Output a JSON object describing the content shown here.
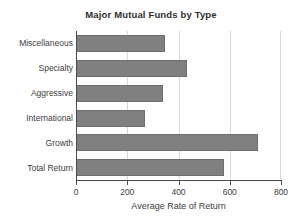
{
  "chart_data": {
    "type": "bar",
    "orientation": "horizontal",
    "title": "Major Mutual Funds by Type",
    "xlabel": "Average Rate of Return",
    "ylabel": "",
    "categories": [
      "Total Return",
      "Growth",
      "International",
      "Aggressive",
      "Specialty",
      "Miscellaneous"
    ],
    "values": [
      577,
      710,
      269,
      340,
      433,
      347
    ],
    "xlim": [
      0,
      800
    ],
    "xticks": [
      0,
      200,
      400,
      600,
      800
    ],
    "xtick_labels": [
      "0",
      "200",
      "400",
      "600",
      "800"
    ],
    "grid": "vertical",
    "legend": "none",
    "series": [
      {
        "name": "Average Rate of Return",
        "values": [
          577,
          710,
          269,
          340,
          433,
          347
        ]
      }
    ],
    "bars": [
      {
        "label": "Miscellaneous",
        "value": 347
      },
      {
        "label": "Specialty",
        "value": 433
      },
      {
        "label": "Aggressive",
        "value": 340
      },
      {
        "label": "International",
        "value": 269
      },
      {
        "label": "Growth",
        "value": 710
      },
      {
        "label": "Total Return",
        "value": 577
      }
    ]
  },
  "colors": {
    "bar_fill": "#808080",
    "bar_stroke": "#6e6e6e",
    "gridline": "#d8d8d8",
    "axis": "#4a4a4a",
    "text": "#3d3d3d",
    "background": "#ffffff"
  }
}
